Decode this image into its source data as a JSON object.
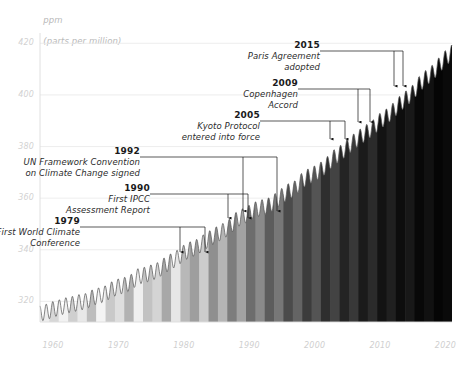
{
  "chart_data": {
    "type": "area",
    "title": "",
    "subtitle": "",
    "ylabel_line1": "ppm",
    "ylabel_line2": "(parts per million)",
    "xlabel": "",
    "grid": true,
    "legend": "none",
    "xlim": [
      1958,
      2021
    ],
    "ylim": [
      312,
      424
    ],
    "x_ticks": [
      "1960",
      "1970",
      "1980",
      "1990",
      "2000",
      "2010",
      "2020"
    ],
    "x_tick_values": [
      1960,
      1970,
      1980,
      1990,
      2000,
      2010,
      2020
    ],
    "y_ticks": [
      "320",
      "340",
      "360",
      "380",
      "400",
      "420"
    ],
    "y_tick_values": [
      320,
      340,
      360,
      380,
      400,
      420
    ],
    "series": [
      {
        "name": "Atmospheric CO2 concentration",
        "x": [
          1958,
          1959,
          1960,
          1961,
          1962,
          1963,
          1964,
          1965,
          1966,
          1967,
          1968,
          1969,
          1970,
          1971,
          1972,
          1973,
          1974,
          1975,
          1976,
          1977,
          1978,
          1979,
          1980,
          1981,
          1982,
          1983,
          1984,
          1985,
          1986,
          1987,
          1988,
          1989,
          1990,
          1991,
          1992,
          1993,
          1994,
          1995,
          1996,
          1997,
          1998,
          1999,
          2000,
          2001,
          2002,
          2003,
          2004,
          2005,
          2006,
          2007,
          2008,
          2009,
          2010,
          2011,
          2012,
          2013,
          2014,
          2015,
          2016,
          2017,
          2018,
          2019,
          2020,
          2021
        ],
        "values": [
          315.3,
          315.9,
          316.9,
          317.6,
          318.4,
          318.9,
          319.6,
          320.0,
          321.4,
          322.2,
          323.0,
          324.6,
          325.7,
          326.3,
          327.5,
          329.7,
          330.2,
          331.1,
          332.0,
          333.8,
          335.4,
          336.8,
          338.8,
          340.1,
          341.0,
          342.8,
          344.4,
          345.9,
          347.2,
          348.9,
          351.5,
          352.9,
          354.2,
          355.6,
          356.4,
          357.1,
          358.8,
          360.8,
          362.6,
          363.7,
          366.6,
          368.3,
          369.5,
          371.0,
          373.2,
          375.8,
          377.5,
          379.8,
          381.9,
          383.8,
          385.6,
          387.4,
          389.9,
          391.6,
          393.8,
          396.5,
          398.6,
          400.8,
          404.2,
          406.5,
          408.5,
          411.4,
          414.2,
          416.5
        ],
        "style": "sawtooth-line-with-warming-stripes-fill"
      }
    ],
    "fill_description": "warming stripes, light grey on left progressing to near-black on right",
    "stripe_colors": [
      "#eeeeee",
      "#d7d7d7",
      "#f2f2f2",
      "#cfcfcf",
      "#e8e8e8",
      "#bdbdbd",
      "#f4f4f4",
      "#c9c9c9",
      "#dedede",
      "#b2b2b2",
      "#efefef",
      "#c2c2c2",
      "#d4d4d4",
      "#a8a8a8",
      "#e6e6e6",
      "#b8b8b8",
      "#9e9e9e",
      "#cccccc",
      "#8f8f8f",
      "#b5b5b5",
      "#7d7d7d",
      "#a2a2a2",
      "#6d6d6d",
      "#8a8a8a",
      "#5c5c5c",
      "#777777",
      "#4b4b4b",
      "#646464",
      "#3c3c3c",
      "#545454",
      "#2e2e2e",
      "#434343",
      "#242424",
      "#383838",
      "#1b1b1b",
      "#2b2b2b",
      "#131313",
      "#202020",
      "#0d0d0d",
      "#181818",
      "#080808",
      "#111111",
      "#050505",
      "#0a0a0a"
    ],
    "annotations": [
      {
        "year": "1979",
        "text_line1": "First World Climate",
        "text_line2": "Conference",
        "x_value": 1979,
        "label_x": 78,
        "label_y": 216,
        "elbow_x": 205,
        "elbow_y": 227,
        "arrow_x": 180,
        "arrow_y_top": 227,
        "arrow_y_bottom": 252
      },
      {
        "year": "1990",
        "text_line1": "First IPCC",
        "text_line2": "Assessment Report",
        "x_value": 1990,
        "label_x": 148,
        "label_y": 183,
        "elbow_x": 248,
        "elbow_y": 194,
        "arrow_x": 228,
        "arrow_y_top": 194,
        "arrow_y_bottom": 218
      },
      {
        "year": "1992",
        "text_line1": "UN Framework Convention",
        "text_line2": "on Climate Change signed",
        "x_value": 1992,
        "label_x": 138,
        "label_y": 146,
        "elbow_x": 277,
        "elbow_y": 157,
        "arrow_x": 243,
        "arrow_y_top": 157,
        "arrow_y_bottom": 211
      },
      {
        "year": "2005",
        "text_line1": "Kyoto Protocol",
        "text_line2": "entered into force",
        "x_value": 2005,
        "label_x": 258,
        "label_y": 110,
        "elbow_x": 345,
        "elbow_y": 121,
        "arrow_x": 330,
        "arrow_y_top": 121,
        "arrow_y_bottom": 139
      },
      {
        "year": "2009",
        "text_line1": "Copenhagen",
        "text_line2": "Accord",
        "x_value": 2009,
        "label_x": 296,
        "label_y": 78,
        "elbow_x": 370,
        "elbow_y": 89,
        "arrow_x": 358,
        "arrow_y_top": 89,
        "arrow_y_bottom": 122
      },
      {
        "year": "2015",
        "text_line1": "Paris Agreement",
        "text_line2": "adopted",
        "x_value": 2015,
        "label_x": 318,
        "label_y": 40,
        "elbow_x": 403,
        "elbow_y": 51,
        "arrow_x": 394,
        "arrow_y_top": 51,
        "arrow_y_bottom": 86
      }
    ]
  }
}
